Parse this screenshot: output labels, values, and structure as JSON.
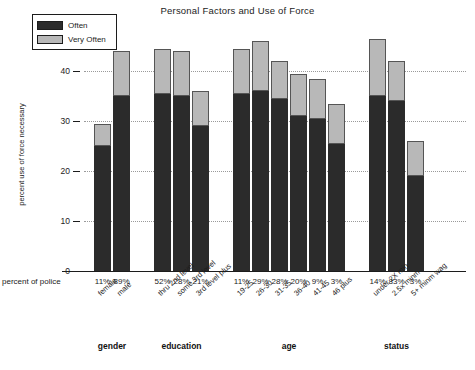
{
  "chart_data": {
    "type": "bar",
    "title": "Personal Factors and Use of Force",
    "xlabel": "",
    "ylabel": "percent use of force necessary",
    "ylim": [
      0,
      47
    ],
    "yticks": [
      0,
      10,
      20,
      30,
      40
    ],
    "grid": true,
    "stacked": true,
    "legend_position": "top-left",
    "legend": [
      "Often",
      "Very Often"
    ],
    "pct_row_label": "percent of police",
    "groups": [
      {
        "name": "gender",
        "categories": [
          "female",
          "male"
        ],
        "percent_of_police": [
          "11%",
          "89%"
        ],
        "series": [
          {
            "name": "Often",
            "values": [
              25.0,
              35.0
            ]
          },
          {
            "name": "Very Often",
            "values": [
              4.5,
              9.0
            ]
          }
        ],
        "totals": [
          29.5,
          44.0
        ]
      },
      {
        "name": "education",
        "categories": [
          "thru 2nd level",
          "some 3rd level",
          "3rd level plus"
        ],
        "percent_of_police": [
          "52%",
          "28%",
          "21%"
        ],
        "series": [
          {
            "name": "Often",
            "values": [
              35.5,
              35.0,
              29.0
            ]
          },
          {
            "name": "Very Often",
            "values": [
              9.0,
              9.0,
              7.0
            ]
          }
        ],
        "totals": [
          44.5,
          44.0,
          36.0
        ]
      },
      {
        "name": "age",
        "categories": [
          "19-25",
          "26-30",
          "31-35",
          "36-40",
          "41-45",
          "46 plus"
        ],
        "percent_of_police": [
          "11%",
          "29%",
          "28%",
          "20%",
          "9%",
          "3%"
        ],
        "series": [
          {
            "name": "Often",
            "values": [
              35.5,
              36.0,
              34.5,
              31.0,
              30.5,
              25.5
            ]
          },
          {
            "name": "Very Often",
            "values": [
              9.0,
              10.0,
              7.5,
              8.5,
              8.0,
              8.0
            ]
          }
        ],
        "totals": [
          44.5,
          46.0,
          42.0,
          39.5,
          38.5,
          33.5
        ]
      },
      {
        "name": "status",
        "categories": [
          "under 2X min",
          "2.5x minm",
          "5+ minm wag"
        ],
        "percent_of_police": [
          "14%",
          "83%",
          "3%"
        ],
        "series": [
          {
            "name": "Often",
            "values": [
              35.0,
              34.0,
              19.0
            ]
          },
          {
            "name": "Very Often",
            "values": [
              11.5,
              8.0,
              7.0
            ]
          }
        ],
        "totals": [
          46.5,
          42.0,
          26.0
        ]
      }
    ]
  },
  "colors": {
    "often": "#2b2b2b",
    "very_often": "#b8b8b8",
    "axis": "#1c1c1c",
    "grid": "#9a9a9a",
    "background": "#ffffff"
  }
}
